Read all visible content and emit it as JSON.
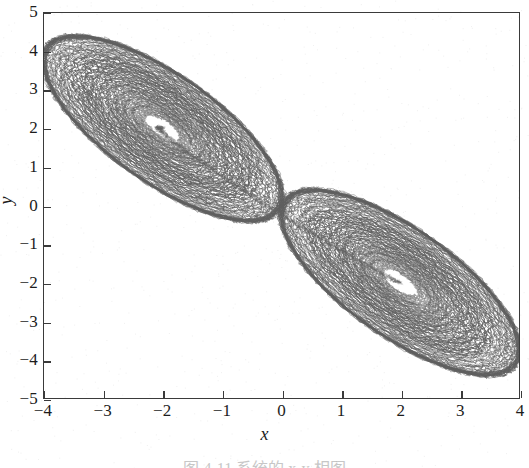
{
  "figure": {
    "caption": "图 4-11  系统的 x-y 相图",
    "background_color": "#ffffff",
    "line_color": "#5f5f5f",
    "axis_color": "#3a3a3a"
  },
  "axes": {
    "x_title": "x",
    "y_title": "y",
    "x_ticks": [
      "-4",
      "-3",
      "-2",
      "-1",
      "0",
      "1",
      "2",
      "3",
      "4"
    ],
    "y_ticks": [
      "5",
      "4",
      "3",
      "2",
      "1",
      "0",
      "-1",
      "-2",
      "-3",
      "-4",
      "-5"
    ]
  },
  "chart_data": {
    "type": "line",
    "title": "",
    "subtitle": "",
    "xlabel": "x",
    "ylabel": "y",
    "xlim": [
      -4,
      4
    ],
    "ylim": [
      -5,
      5
    ],
    "xticks": [
      -4,
      -3,
      -2,
      -1,
      0,
      1,
      2,
      3,
      4
    ],
    "yticks": [
      -5,
      -4,
      -3,
      -2,
      -1,
      0,
      1,
      2,
      3,
      4,
      5
    ],
    "grid": false,
    "legend": "none",
    "annotations": [
      {
        "label": "upper-left spiral focus",
        "x": -2.0,
        "y": 2.0
      },
      {
        "label": "lower-right spiral focus",
        "x": 2.0,
        "y": -2.0
      },
      {
        "label": "upper-left outer tip",
        "x": -3.45,
        "y": 4.85
      },
      {
        "label": "lower-right outer tip",
        "x": 3.45,
        "y": -4.85
      },
      {
        "label": "saddle / crossing region",
        "x": 0.0,
        "y": 0.0
      }
    ],
    "series": [
      {
        "name": "trajectory",
        "attractor": "double-scroll",
        "color": "#5f5f5f",
        "focus_left": [
          -2.0,
          2.0
        ],
        "focus_right": [
          2.0,
          -2.0
        ],
        "major_axis_angle_deg": -52,
        "lobe_semi_major": 2.95,
        "lobe_semi_minor": 1.15,
        "num_windings": 14,
        "inner_radius_fraction": 0.14,
        "x_range": [
          -3.5,
          3.5
        ],
        "y_range": [
          -4.9,
          4.9
        ]
      }
    ]
  }
}
